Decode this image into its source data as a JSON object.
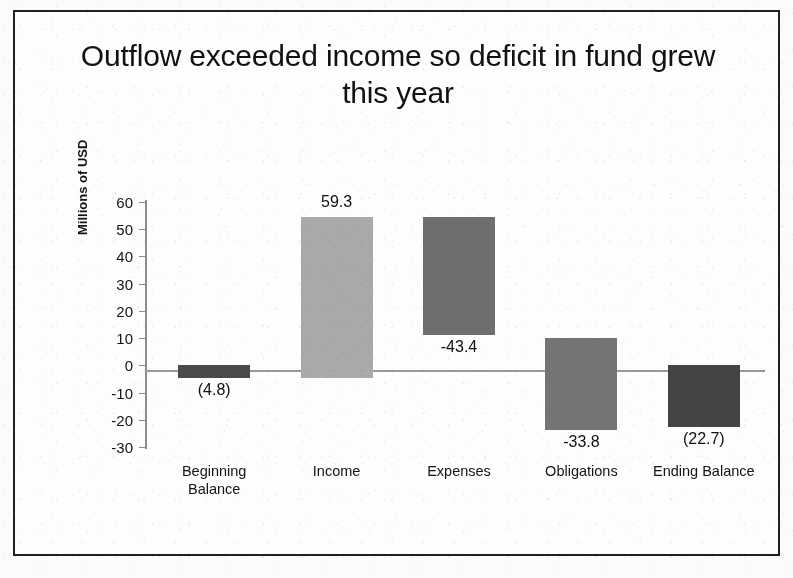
{
  "slide": {
    "title": "Outflow exceeded income so deficit in fund grew this year"
  },
  "colors": {
    "paper": "#fdfdfb",
    "frame": "#231f20",
    "axis": "#8d8d8d",
    "bar_beginning": "#4a4a4a",
    "bar_income": "#a9a9a9",
    "bar_expenses": "#6e6e6e",
    "bar_obligations": "#747474",
    "bar_ending": "#444444"
  },
  "chart_data": {
    "type": "bar",
    "chart_subtype": "waterfall",
    "title": "Outflow exceeded income so deficit in fund grew this year",
    "xlabel": "",
    "ylabel": "Millions of USD",
    "ylim": [
      -30,
      60
    ],
    "ytick_step": 10,
    "yticks": [
      "60",
      "50",
      "40",
      "30",
      "20",
      "10",
      "0",
      "-10",
      "-20",
      "-30"
    ],
    "ytick_values": [
      60,
      50,
      40,
      30,
      20,
      10,
      0,
      -10,
      -20,
      -30
    ],
    "grid": false,
    "legend": false,
    "zero_line": true,
    "categories": [
      "Beginning\nBalance",
      "Income",
      "Expenses",
      "Obligations",
      "Ending Balance"
    ],
    "category_labels_flat": [
      "Beginning Balance",
      "Income",
      "Expenses",
      "Obligations",
      "Ending Balance"
    ],
    "values": [
      -4.8,
      59.3,
      -43.4,
      -33.8,
      -22.7
    ],
    "data_labels": [
      "(4.8)",
      "59.3",
      "-43.4",
      "-33.8",
      "(22.7)"
    ],
    "bars": [
      {
        "name": "Beginning Balance",
        "label": "(4.8)",
        "value": -4.8,
        "base": 0.0,
        "top": 0.0,
        "bottom": -4.8,
        "color": "#4a4a4a",
        "label_position": "below"
      },
      {
        "name": "Income",
        "label": "59.3",
        "value": 59.3,
        "base": -4.8,
        "top": 54.5,
        "bottom": -4.8,
        "color": "#a9a9a9",
        "label_position": "above"
      },
      {
        "name": "Expenses",
        "label": "-43.4",
        "value": -43.4,
        "base": 54.5,
        "top": 54.5,
        "bottom": 11.1,
        "color": "#6e6e6e",
        "label_position": "below"
      },
      {
        "name": "Obligations",
        "label": "-33.8",
        "value": -33.8,
        "base": 10.0,
        "top": 10.0,
        "bottom": -23.8,
        "color": "#747474",
        "label_position": "below"
      },
      {
        "name": "Ending Balance",
        "label": "(22.7)",
        "value": -22.7,
        "base": 0.0,
        "top": 0.0,
        "bottom": -22.7,
        "color": "#444444",
        "label_position": "below"
      }
    ]
  }
}
